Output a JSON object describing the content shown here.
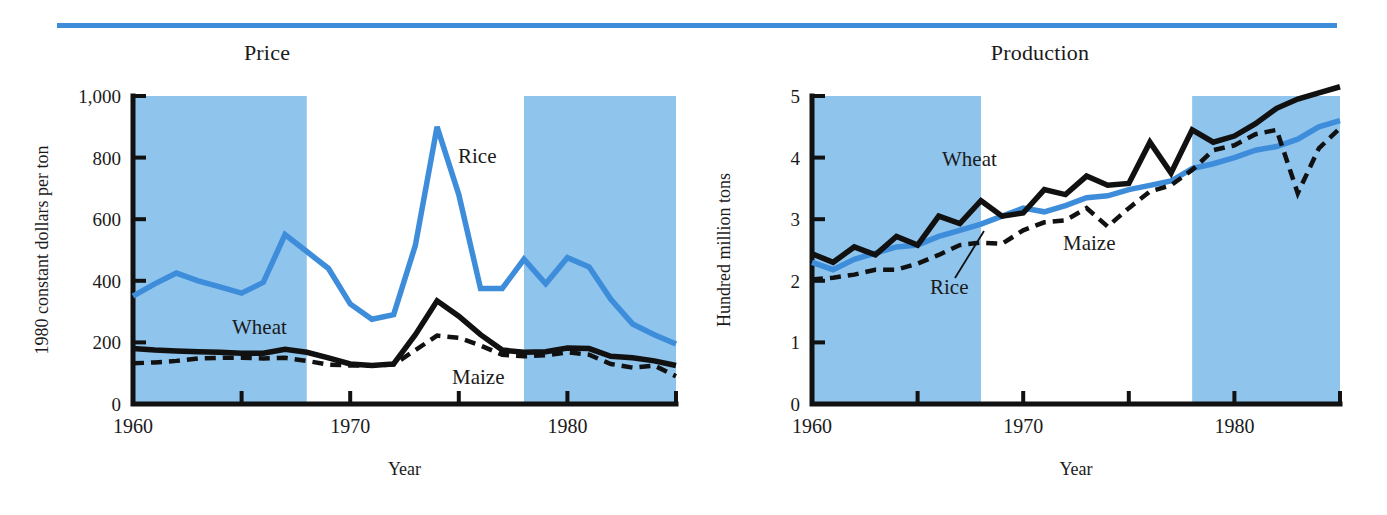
{
  "figure": {
    "accent_color": "#3d8ddb",
    "band_color": "#8fc4ec",
    "line_color_dark": "#111111",
    "background": "#ffffff"
  },
  "panels": [
    {
      "id": "price",
      "title": "Price",
      "ylabel": "1980 constant dollars per ton",
      "xlabel": "Year",
      "yticks": [
        "0",
        "200",
        "400",
        "600",
        "800",
        "1,000"
      ],
      "xticks": [
        "1960",
        "1970",
        "1980"
      ],
      "series_labels": [
        {
          "name": "Rice",
          "text": "Rice"
        },
        {
          "name": "Wheat",
          "text": "Wheat"
        },
        {
          "name": "Maize",
          "text": "Maize"
        }
      ]
    },
    {
      "id": "production",
      "title": "Production",
      "ylabel": "Hundred million tons",
      "xlabel": "Year",
      "yticks": [
        "0",
        "1",
        "2",
        "3",
        "4",
        "5"
      ],
      "xticks": [
        "1960",
        "1970",
        "1980"
      ],
      "series_labels": [
        {
          "name": "Wheat",
          "text": "Wheat"
        },
        {
          "name": "Rice",
          "text": "Rice"
        },
        {
          "name": "Maize",
          "text": "Maize"
        }
      ]
    }
  ],
  "chart_data": [
    {
      "type": "line",
      "id": "price",
      "title": "Price",
      "xlabel": "Year",
      "ylabel": "1980 constant dollars per ton",
      "xlim": [
        1960,
        1985
      ],
      "ylim": [
        0,
        1000
      ],
      "ytick_values": [
        0,
        200,
        400,
        600,
        800,
        1000
      ],
      "ytick_labels": [
        "0",
        "200",
        "400",
        "600",
        "800",
        "1,000"
      ],
      "xtick_values": [
        1960,
        1965,
        1970,
        1975,
        1980,
        1985
      ],
      "xtick_labels": [
        "1960",
        "",
        "1970",
        "",
        "1980",
        ""
      ],
      "grid": false,
      "legend": "inline-annotations",
      "shaded_bands": [
        {
          "start": 1960,
          "end": 1968
        },
        {
          "start": 1978,
          "end": 1985
        }
      ],
      "x": [
        1960,
        1961,
        1962,
        1963,
        1964,
        1965,
        1966,
        1967,
        1968,
        1969,
        1970,
        1971,
        1972,
        1973,
        1974,
        1975,
        1976,
        1977,
        1978,
        1979,
        1980,
        1981,
        1982,
        1983,
        1984,
        1985
      ],
      "series": [
        {
          "name": "Rice",
          "style": "solid",
          "color": "#3d8ddb",
          "values": [
            350,
            390,
            425,
            400,
            380,
            360,
            395,
            550,
            495,
            440,
            325,
            275,
            290,
            515,
            900,
            680,
            375,
            375,
            470,
            390,
            475,
            445,
            340,
            260,
            225,
            195
          ]
        },
        {
          "name": "Wheat",
          "style": "solid",
          "color": "#111111",
          "values": [
            180,
            175,
            172,
            170,
            168,
            165,
            165,
            178,
            168,
            150,
            130,
            125,
            130,
            225,
            335,
            285,
            225,
            175,
            168,
            170,
            182,
            180,
            155,
            150,
            140,
            125
          ]
        },
        {
          "name": "Maize",
          "style": "dashed",
          "color": "#111111",
          "values": [
            132,
            135,
            140,
            148,
            150,
            150,
            148,
            150,
            140,
            128,
            125,
            125,
            128,
            175,
            222,
            215,
            190,
            160,
            155,
            158,
            168,
            160,
            130,
            118,
            125,
            90
          ]
        }
      ]
    },
    {
      "type": "line",
      "id": "production",
      "title": "Production",
      "xlabel": "Year",
      "ylabel": "Hundred million tons",
      "xlim": [
        1960,
        1985
      ],
      "ylim": [
        0,
        5
      ],
      "ytick_values": [
        0,
        1,
        2,
        3,
        4,
        5
      ],
      "ytick_labels": [
        "0",
        "1",
        "2",
        "3",
        "4",
        "5"
      ],
      "xtick_values": [
        1960,
        1965,
        1970,
        1975,
        1980,
        1985
      ],
      "xtick_labels": [
        "1960",
        "",
        "1970",
        "",
        "1980",
        ""
      ],
      "grid": false,
      "legend": "inline-annotations",
      "shaded_bands": [
        {
          "start": 1960,
          "end": 1968
        },
        {
          "start": 1978,
          "end": 1985
        }
      ],
      "x": [
        1960,
        1961,
        1962,
        1963,
        1964,
        1965,
        1966,
        1967,
        1968,
        1969,
        1970,
        1971,
        1972,
        1973,
        1974,
        1975,
        1976,
        1977,
        1978,
        1979,
        1980,
        1981,
        1982,
        1983,
        1984,
        1985
      ],
      "series": [
        {
          "name": "Wheat",
          "style": "solid",
          "color": "#111111",
          "values": [
            2.44,
            2.3,
            2.55,
            2.42,
            2.72,
            2.58,
            3.05,
            2.93,
            3.3,
            3.05,
            3.1,
            3.48,
            3.4,
            3.7,
            3.55,
            3.58,
            4.25,
            3.75,
            4.45,
            4.25,
            4.35,
            4.55,
            4.8,
            4.95,
            5.05,
            5.15
          ]
        },
        {
          "name": "Rice",
          "style": "solid",
          "color": "#3d8ddb",
          "values": [
            2.3,
            2.18,
            2.35,
            2.45,
            2.55,
            2.58,
            2.72,
            2.82,
            2.92,
            3.05,
            3.18,
            3.12,
            3.22,
            3.35,
            3.38,
            3.48,
            3.55,
            3.62,
            3.82,
            3.9,
            4.0,
            4.12,
            4.18,
            4.3,
            4.5,
            4.6
          ]
        },
        {
          "name": "Maize",
          "style": "dashed",
          "color": "#111111",
          "values": [
            2.02,
            2.05,
            2.1,
            2.18,
            2.18,
            2.28,
            2.42,
            2.58,
            2.62,
            2.6,
            2.82,
            2.95,
            2.98,
            3.18,
            2.88,
            3.18,
            3.45,
            3.55,
            3.8,
            4.12,
            4.2,
            4.38,
            4.45,
            3.42,
            4.15,
            4.48
          ]
        }
      ]
    }
  ]
}
